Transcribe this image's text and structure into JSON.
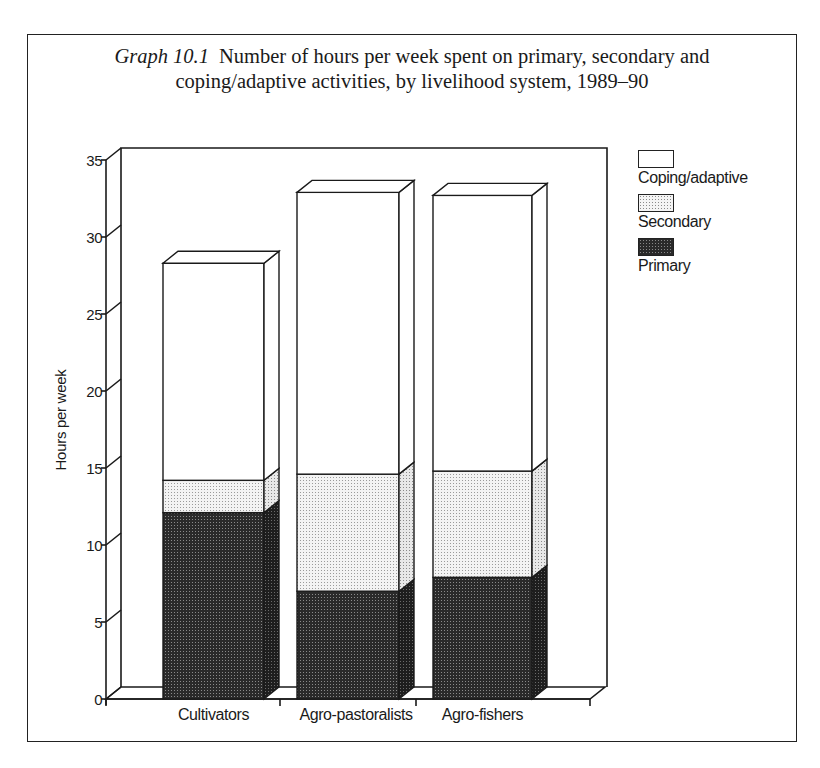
{
  "figure": {
    "title_lead": "Graph 10.1",
    "title_line1": "Number of hours per week spent on primary, secondary and",
    "title_line2": "coping/adaptive activities, by livelihood system, 1989–90"
  },
  "colors": {
    "primary": "#2b2b2b",
    "secondary": "#d9d9d9",
    "coping": "#ffffff",
    "line": "#1a1a1a"
  },
  "chart_data": {
    "type": "bar",
    "stacked": true,
    "three_d": true,
    "xlabel": "",
    "ylabel": "Hours per week",
    "ylim": [
      0,
      35
    ],
    "yticks": [
      0,
      5,
      10,
      15,
      20,
      25,
      30,
      35
    ],
    "categories": [
      "Cultivators",
      "Agro-pastoralists",
      "Agro-fishers"
    ],
    "series": [
      {
        "name": "Primary",
        "pattern": "dense-dots-dark",
        "values": [
          12.1,
          7.0,
          7.9
        ]
      },
      {
        "name": "Secondary",
        "pattern": "light-dots",
        "values": [
          2.1,
          7.6,
          6.9
        ]
      },
      {
        "name": "Coping/adaptive",
        "pattern": "white",
        "values": [
          14.1,
          18.3,
          17.9
        ]
      }
    ],
    "totals": [
      28.3,
      32.9,
      32.7
    ],
    "legend": {
      "position": "right",
      "entries": [
        "Coping/adaptive",
        "Secondary",
        "Primary"
      ]
    },
    "grid": false
  },
  "legend_items": [
    {
      "label": "Coping/adaptive",
      "key": "coping"
    },
    {
      "label": "Secondary",
      "key": "secondary"
    },
    {
      "label": "Primary",
      "key": "primary"
    }
  ]
}
